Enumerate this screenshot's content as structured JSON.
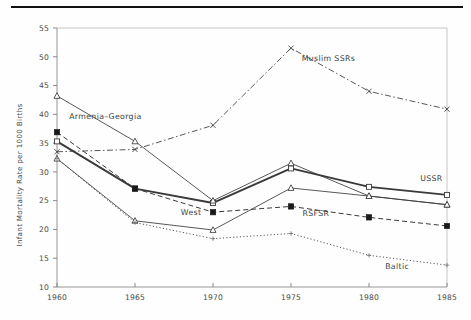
{
  "figure": {
    "title": "",
    "ylabel": "Infant Mortality Rate per 1000 Births",
    "xlabel": ""
  },
  "axes": {
    "y_ticks": [
      "10",
      "15",
      "20",
      "25",
      "30",
      "35",
      "40",
      "45",
      "50",
      "55"
    ],
    "x_ticks": [
      "1960",
      "1965",
      "1970",
      "1975",
      "1980",
      "1985"
    ]
  },
  "labels": {
    "ussr": "USSR",
    "rsfsr": "RSFSR",
    "west": "West",
    "baltic": "Baltic",
    "armenia_georgia": "Armenia–Georgia",
    "muslim_ssrs": "Muslim SSRs"
  },
  "colors": {
    "ink": "#3a3a3a",
    "rule": "#111111",
    "frame": "#8a8a8a",
    "background": "#fefefe"
  },
  "chart_data": {
    "type": "line",
    "title": "",
    "xlabel": "",
    "ylabel": "Infant Mortality Rate per 1000 Births",
    "x": [
      1960,
      1965,
      1970,
      1975,
      1980,
      1985
    ],
    "xlim": [
      1960,
      1985
    ],
    "ylim": [
      10,
      55
    ],
    "ytick_step": 5,
    "grid": false,
    "legend": "inline-labels",
    "series": [
      {
        "name": "USSR",
        "values": [
          35.3,
          27.1,
          24.6,
          30.6,
          27.4,
          26.0
        ],
        "line": "solid-thick",
        "marker": "open-square",
        "label_x": 1984.0,
        "label_y": 28.4
      },
      {
        "name": "RSFSR",
        "values": [
          36.9,
          27.1,
          23.0,
          24.0,
          22.1,
          20.6
        ],
        "line": "dashed",
        "marker": "filled-square",
        "label_x": 1976.6,
        "label_y": 22.3
      },
      {
        "name": "West",
        "values": [
          32.3,
          21.5,
          19.9,
          27.2,
          25.8,
          24.3
        ],
        "line": "solid-thin",
        "marker": "open-triangle",
        "label_x": 1968.6,
        "label_y": 22.5
      },
      {
        "name": "Baltic",
        "values": [
          32.3,
          21.2,
          18.4,
          19.3,
          15.5,
          13.8
        ],
        "line": "dotted",
        "marker": "small-plus",
        "label_x": 1981.8,
        "label_y": 13.2
      },
      {
        "name": "Armenia–Georgia",
        "values": [
          43.2,
          35.3,
          25.0,
          31.5,
          25.8,
          24.3
        ],
        "line": "solid-thin",
        "marker": "open-triangle",
        "label_x": 1963.1,
        "label_y": 39.2
      },
      {
        "name": "Muslim SSRs",
        "values": [
          33.5,
          33.9,
          38.1,
          51.5,
          44.0,
          40.9
        ],
        "line": "dash-dot",
        "marker": "x-cross",
        "label_x": 1977.4,
        "label_y": 49.3
      }
    ]
  }
}
